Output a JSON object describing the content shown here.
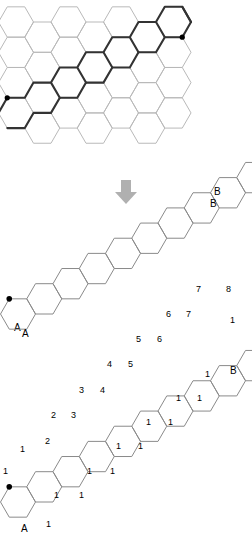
{
  "figure": {
    "colors": {
      "faint_line": "#b9b9b9",
      "bold_line": "#333333",
      "chain_line": "#8a8a8a",
      "node_dot": "#000000",
      "arrow": "#b0b0b0",
      "text": "#1a1a1a",
      "background": "#ffffff"
    }
  },
  "panels": {
    "grid": {
      "name": "honeycomb-grid-with-highlighted-path",
      "start_label": "A",
      "end_label": "B",
      "hex": {
        "radius": 17.5,
        "columns": 7,
        "rows": 4
      },
      "origin": {
        "x": 16,
        "y": 22
      },
      "highlighted_path_description": "bold staircase boundary from A (lower-left) to B (upper-right)"
    },
    "arrow": {
      "name": "down-arrow",
      "glyph": "arrow-down-icon",
      "direction": "down"
    },
    "chain": {
      "name": "extracted-hexagon-staircase",
      "start_label": "A",
      "end_label": "B",
      "hex_count": 13,
      "hex": {
        "radius": 17.5
      },
      "origin": {
        "x": 18,
        "y": 118
      }
    },
    "counts": {
      "name": "hexagon-staircase-with-path-counts",
      "start_label": "A",
      "end_label": "B",
      "hex_count": 13,
      "hex": {
        "radius": 17.5
      },
      "origin": {
        "x": 18,
        "y": 162
      },
      "lower_row_values": [
        "1",
        "1",
        "1",
        "1",
        "1",
        "1",
        "1",
        "1",
        "1",
        "1",
        "1",
        "1",
        "1",
        "1",
        "1",
        "1",
        "1",
        "1"
      ],
      "upper_row_values": [
        "1",
        "1",
        "2",
        "2",
        "3",
        "3",
        "4",
        "4",
        "5",
        "5",
        "6",
        "6",
        "7",
        "7",
        "8"
      ],
      "annotations": [
        {
          "text": "1",
          "x": 3,
          "y": 466
        },
        {
          "text": "1",
          "x": 20,
          "y": 444
        },
        {
          "text": "1",
          "x": 46,
          "y": 519
        },
        {
          "text": "1",
          "x": 54,
          "y": 490
        },
        {
          "text": "2",
          "x": 45,
          "y": 436
        },
        {
          "text": "2",
          "x": 51,
          "y": 410
        },
        {
          "text": "1",
          "x": 79,
          "y": 490
        },
        {
          "text": "1",
          "x": 87,
          "y": 466
        },
        {
          "text": "3",
          "x": 71,
          "y": 410
        },
        {
          "text": "3",
          "x": 79,
          "y": 385
        },
        {
          "text": "1",
          "x": 110,
          "y": 466
        },
        {
          "text": "1",
          "x": 116,
          "y": 441
        },
        {
          "text": "4",
          "x": 100,
          "y": 385
        },
        {
          "text": "4",
          "x": 107,
          "y": 359
        },
        {
          "text": "1",
          "x": 138,
          "y": 441
        },
        {
          "text": "1",
          "x": 146,
          "y": 417
        },
        {
          "text": "5",
          "x": 128,
          "y": 359
        },
        {
          "text": "5",
          "x": 136,
          "y": 334
        },
        {
          "text": "1",
          "x": 168,
          "y": 417
        },
        {
          "text": "1",
          "x": 176,
          "y": 393
        },
        {
          "text": "6",
          "x": 157,
          "y": 334
        },
        {
          "text": "6",
          "x": 166,
          "y": 309
        },
        {
          "text": "1",
          "x": 197,
          "y": 393
        },
        {
          "text": "1",
          "x": 205,
          "y": 369
        },
        {
          "text": "7",
          "x": 186,
          "y": 309
        },
        {
          "text": "7",
          "x": 196,
          "y": 284
        },
        {
          "text": "8",
          "x": 226,
          "y": 284
        },
        {
          "text": "1",
          "x": 230,
          "y": 315
        }
      ]
    }
  }
}
